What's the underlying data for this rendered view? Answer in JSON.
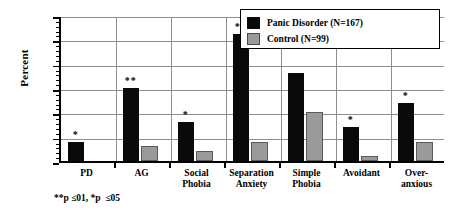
{
  "chart_data": {
    "type": "bar",
    "title": "",
    "xlabel": "",
    "ylabel": "Percent",
    "ylim": [
      0,
      30
    ],
    "ytick_values": [
      0,
      5,
      10,
      15,
      20,
      25,
      30
    ],
    "ytick_labels": [
      "0",
      "5",
      "10",
      "15",
      "20",
      "25",
      "30"
    ],
    "grid": true,
    "legend_position": "top-right",
    "categories": [
      "PD",
      "AG",
      "Social Phobia",
      "Separation Anxiety",
      "Simple Phobia",
      "Avoidant",
      "Over-anxious"
    ],
    "category_lines": [
      [
        "PD"
      ],
      [
        "AG"
      ],
      [
        "Social",
        "Phobia"
      ],
      [
        "Separation",
        "Anxiety"
      ],
      [
        "Simple",
        "Phobia"
      ],
      [
        "Avoidant"
      ],
      [
        "Over-",
        "anxious"
      ]
    ],
    "series": [
      {
        "name": "Panic Disorder (N=167)",
        "color": "#0a0a0a",
        "values": [
          4,
          15,
          8,
          26,
          18,
          7,
          12
        ]
      },
      {
        "name": "Control (N=99)",
        "color": "#9a9a9a",
        "values": [
          0,
          3,
          2,
          4,
          10,
          1,
          4
        ]
      }
    ],
    "significance_markers": [
      "*",
      "**",
      "*",
      "**",
      "",
      "*",
      "*"
    ],
    "annotations": [
      "**p ≤01, *p  ≤05"
    ]
  },
  "legend": {
    "items": [
      {
        "label": "Panic Disorder (N=167)",
        "swatch": "black-square-swatch"
      },
      {
        "label": "Control (N=99)",
        "swatch": "gray-square-swatch"
      }
    ]
  },
  "axis": {
    "y_title": "Percent"
  },
  "footnote": {
    "text": "**p ≤01, *p  ≤05"
  }
}
